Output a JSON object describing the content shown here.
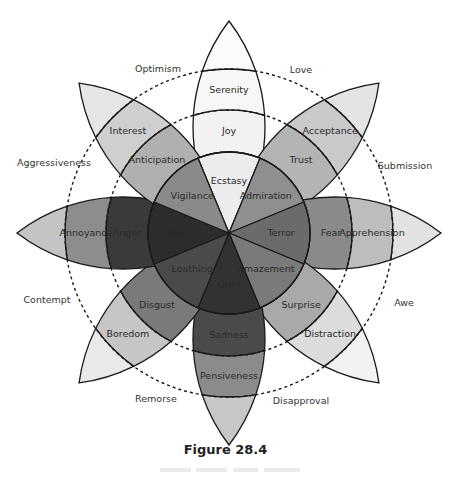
{
  "figure": {
    "title": "Figure 28.4",
    "caption_line_illegible": true
  },
  "wheel": {
    "center": [
      229,
      233
    ],
    "tip_radius": 212,
    "inner_circle_radius": 81,
    "inner_dashed_radius": 123,
    "outer_dashed_radius": 164,
    "petal_half_width": 36,
    "stroke_color": "#1a1a1a",
    "petals": [
      {
        "angle": -90,
        "inner": "Ecstasy",
        "middle": "Joy",
        "outer": "Serenity",
        "colors": [
          "#ececec",
          "#f2f2f2",
          "#f7f7f7",
          "#fbfbfb"
        ]
      },
      {
        "angle": -45,
        "inner": "Admiration",
        "middle": "Trust",
        "outer": "Acceptance",
        "colors": [
          "#8f8f8f",
          "#b4b4b4",
          "#c9c9c9",
          "#e4e4e4"
        ]
      },
      {
        "angle": 0,
        "inner": "Terror",
        "middle": "Fear",
        "outer": "Apprehension",
        "colors": [
          "#6b6b6b",
          "#8a8a8a",
          "#bdbdbd",
          "#e2e2e2"
        ]
      },
      {
        "angle": 45,
        "inner": "Amazement",
        "middle": "Surprise",
        "outer": "Distraction",
        "colors": [
          "#7a7a7a",
          "#a9a9a9",
          "#dcdcdc",
          "#f2f2f2"
        ]
      },
      {
        "angle": 90,
        "inner": "Grief",
        "middle": "Sadness",
        "outer": "Pensiveness",
        "colors": [
          "#323232",
          "#4a4a4a",
          "#8b8b8b",
          "#c7c7c7"
        ]
      },
      {
        "angle": 135,
        "inner": "Loathing",
        "middle": "Disgust",
        "outer": "Boredom",
        "colors": [
          "#4a4a4a",
          "#7a7a7a",
          "#c6c6c6",
          "#e9e9e9"
        ]
      },
      {
        "angle": 180,
        "inner": "Rage",
        "middle": "Anger",
        "outer": "Annoyance",
        "colors": [
          "#2c2c2c",
          "#3a3a3a",
          "#8d8d8d",
          "#c4c4c4"
        ]
      },
      {
        "angle": -135,
        "inner": "Vigilance",
        "middle": "Anticipation",
        "outer": "Interest",
        "colors": [
          "#8a8a8a",
          "#b0b0b0",
          "#cfcfcf",
          "#e6e6e6"
        ]
      }
    ],
    "dyads": [
      {
        "label": "Love",
        "x": 301,
        "y": 70
      },
      {
        "label": "Submission",
        "x": 405,
        "y": 166
      },
      {
        "label": "Awe",
        "x": 404,
        "y": 303
      },
      {
        "label": "Disapproval",
        "x": 301,
        "y": 401
      },
      {
        "label": "Remorse",
        "x": 156,
        "y": 399
      },
      {
        "label": "Contempt",
        "x": 47,
        "y": 300
      },
      {
        "label": "Aggressiveness",
        "x": 54,
        "y": 163
      },
      {
        "label": "Optimism",
        "x": 158,
        "y": 69
      }
    ],
    "label_radii": {
      "inner": 52,
      "middle": 102,
      "outer": 143
    }
  }
}
